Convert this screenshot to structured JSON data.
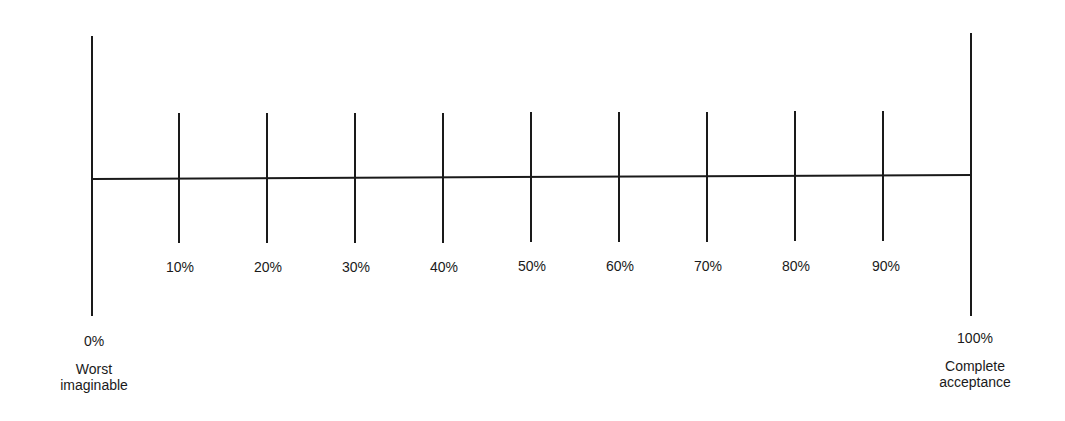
{
  "scale": {
    "start": {
      "value": "0%",
      "caption_line1": "Worst",
      "caption_line2": "imaginable"
    },
    "end": {
      "value": "100%",
      "caption_line1": "Complete",
      "caption_line2": "acceptance"
    },
    "ticks": [
      "10%",
      "20%",
      "30%",
      "40%",
      "50%",
      "60%",
      "70%",
      "80%",
      "90%"
    ]
  }
}
